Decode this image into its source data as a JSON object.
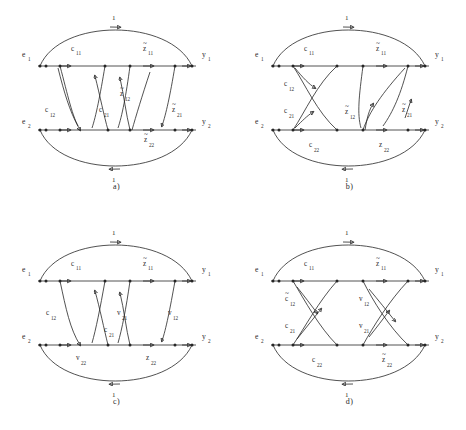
{
  "figure": {
    "type": "signal-flow-graph-set",
    "panel_count": 4,
    "node_terminals": {
      "e1": "e",
      "e1sub": "1",
      "e2": "e",
      "e2sub": "2",
      "y1": "y",
      "y1sub": "1",
      "y2": "y",
      "y2sub": "2"
    },
    "unit_gain": "1"
  },
  "panels": [
    {
      "id": "a",
      "caption": "a)",
      "top_arc_label": "1",
      "bottom_arc_label": "1",
      "left_terminals": [
        "e",
        "e"
      ],
      "left_subs": [
        "1",
        "2"
      ],
      "right_terminals": [
        "y",
        "y"
      ],
      "right_subs": [
        "1",
        "2"
      ],
      "branch_labels": [
        {
          "name": "c11",
          "base": "c",
          "sub": "11",
          "tilde": false,
          "x": 78,
          "y": 51
        },
        {
          "name": "z11",
          "base": "z",
          "sub": "11",
          "tilde": true,
          "x": 150,
          "y": 51
        },
        {
          "name": "c12",
          "base": "c",
          "sub": "12",
          "tilde": false,
          "x": 52,
          "y": 112
        },
        {
          "name": "c21",
          "base": "c",
          "sub": "21",
          "tilde": false,
          "x": 105,
          "y": 112
        },
        {
          "name": "z12",
          "base": "z",
          "sub": "12",
          "tilde": true,
          "x": 126,
          "y": 96
        },
        {
          "name": "z21",
          "base": "z",
          "sub": "21",
          "tilde": true,
          "x": 178,
          "y": 112
        },
        {
          "name": "z22",
          "base": "z",
          "sub": "22",
          "tilde": true,
          "x": 150,
          "y": 142
        }
      ]
    },
    {
      "id": "b",
      "caption": "b)",
      "top_arc_label": "1",
      "bottom_arc_label": "1",
      "left_terminals": [
        "e",
        "e"
      ],
      "left_subs": [
        "1",
        "2"
      ],
      "right_terminals": [
        "y",
        "y"
      ],
      "right_subs": [
        "1",
        "2"
      ],
      "branch_labels": [
        {
          "name": "c11",
          "base": "c",
          "sub": "11",
          "tilde": false,
          "x": 78,
          "y": 51
        },
        {
          "name": "z11",
          "base": "z",
          "sub": "11",
          "tilde": true,
          "x": 150,
          "y": 51
        },
        {
          "name": "c12",
          "base": "c",
          "sub": "12",
          "tilde": false,
          "x": 57,
          "y": 86
        },
        {
          "name": "c21",
          "base": "c",
          "sub": "21",
          "tilde": false,
          "x": 57,
          "y": 113
        },
        {
          "name": "z12",
          "base": "z",
          "sub": "12",
          "tilde": true,
          "x": 118,
          "y": 114
        },
        {
          "name": "z21",
          "base": "z",
          "sub": "21",
          "tilde": true,
          "x": 175,
          "y": 112
        },
        {
          "name": "c22",
          "base": "c",
          "sub": "22",
          "tilde": false,
          "x": 82,
          "y": 147
        },
        {
          "name": "z22",
          "base": "z",
          "sub": "22",
          "tilde": true,
          "x": 152,
          "y": 147
        }
      ]
    },
    {
      "id": "c",
      "caption": "c)",
      "top_arc_label": "1",
      "bottom_arc_label": "1",
      "left_terminals": [
        "e",
        "e"
      ],
      "left_subs": [
        "1",
        "2"
      ],
      "right_terminals": [
        "y",
        "y"
      ],
      "right_subs": [
        "1",
        "2"
      ],
      "branch_labels": [
        {
          "name": "c11",
          "base": "c",
          "sub": "11",
          "tilde": false,
          "x": 78,
          "y": 51
        },
        {
          "name": "z11",
          "base": "z",
          "sub": "11",
          "tilde": true,
          "x": 150,
          "y": 51
        },
        {
          "name": "c12",
          "base": "c",
          "sub": "12",
          "tilde": false,
          "x": 52,
          "y": 100
        },
        {
          "name": "c21",
          "base": "c",
          "sub": "21",
          "tilde": false,
          "x": 110,
          "y": 117
        },
        {
          "name": "v21",
          "base": "v",
          "sub": "21",
          "tilde": false,
          "x": 123,
          "y": 100
        },
        {
          "name": "v12",
          "base": "v",
          "sub": "12",
          "tilde": false,
          "x": 174,
          "y": 100
        },
        {
          "name": "v22",
          "base": "v",
          "sub": "22",
          "tilde": false,
          "x": 82,
          "y": 145
        },
        {
          "name": "z22",
          "base": "z",
          "sub": "22",
          "tilde": true,
          "x": 152,
          "y": 145
        }
      ]
    },
    {
      "id": "d",
      "caption": "d)",
      "top_arc_label": "1",
      "bottom_arc_label": "1",
      "left_terminals": [
        "e",
        "e"
      ],
      "left_subs": [
        "1",
        "2"
      ],
      "right_terminals": [
        "y",
        "y"
      ],
      "right_subs": [
        "1",
        "2"
      ],
      "branch_labels": [
        {
          "name": "c11",
          "base": "c",
          "sub": "11",
          "tilde": false,
          "x": 78,
          "y": 51
        },
        {
          "name": "z11",
          "base": "z",
          "sub": "11",
          "tilde": true,
          "x": 150,
          "y": 51
        },
        {
          "name": "c12",
          "base": "c",
          "sub": "12",
          "tilde": true,
          "x": 58,
          "y": 86
        },
        {
          "name": "c21",
          "base": "c",
          "sub": "21",
          "tilde": false,
          "x": 58,
          "y": 113
        },
        {
          "name": "v12",
          "base": "v",
          "sub": "12",
          "tilde": false,
          "x": 132,
          "y": 86
        },
        {
          "name": "v21",
          "base": "v",
          "sub": "21",
          "tilde": false,
          "x": 132,
          "y": 113
        },
        {
          "name": "c22",
          "base": "c",
          "sub": "22",
          "tilde": false,
          "x": 85,
          "y": 147
        },
        {
          "name": "z22",
          "base": "z",
          "sub": "22",
          "tilde": true,
          "x": 155,
          "y": 147
        }
      ]
    }
  ],
  "colors": {
    "stroke": "#262626",
    "text": "#2b2b2b",
    "background": "#ffffff"
  }
}
